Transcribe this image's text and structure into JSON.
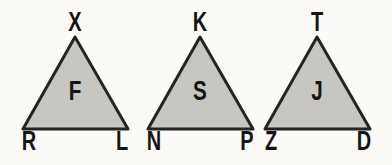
{
  "figure": {
    "triangles": [
      {
        "top": "X",
        "center": "F",
        "bottom_left": "R",
        "bottom_right": "L"
      },
      {
        "top": "K",
        "center": "S",
        "bottom_left": "N",
        "bottom_right": "P"
      },
      {
        "top": "T",
        "center": "J",
        "bottom_left": "Z",
        "bottom_right": "D"
      }
    ],
    "colors": {
      "triangle_fill": "#c7c6c3",
      "triangle_stroke": "#242424",
      "letter_color": "#151515",
      "background": "#fbfaf7"
    }
  }
}
